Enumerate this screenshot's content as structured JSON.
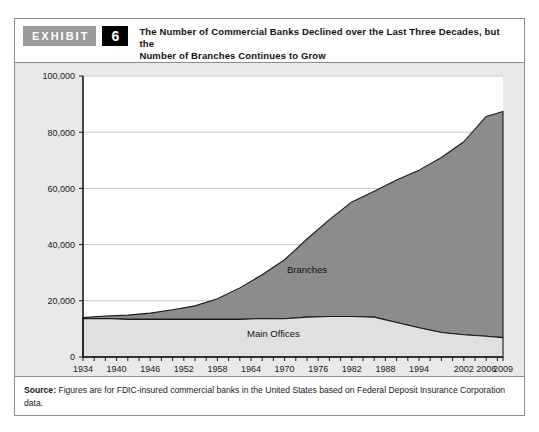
{
  "exhibit": {
    "badge_label": "EXHIBIT",
    "number": "6",
    "title_line1": "The Number of Commercial Banks Declined over the Last Three Decades, but the",
    "title_line2": "Number of Branches Continues to Grow"
  },
  "source": {
    "label": "Source:",
    "text": " Figures are for FDIC-insured commercial banks in the United States based on Federal Deposit Insurance Corporation data."
  },
  "colors": {
    "branches_fill": "#8c8c8c",
    "main_offices_fill": "#e0e0e0",
    "plot_background": "#ffffff",
    "chart_background": "#e9e9e9",
    "gridline": "#c9c9c9",
    "axis": "#1a1a1a",
    "badge_gray": "#9a9a9a",
    "badge_black": "#000000"
  },
  "chart_data": {
    "type": "area",
    "stacked": true,
    "title": "The Number of Commercial Banks Declined over the Last Three Decades, but the Number of Branches Continues to Grow",
    "xlabel": "",
    "ylabel": "",
    "xlim": [
      1934,
      2009
    ],
    "ylim": [
      0,
      100000
    ],
    "grid": true,
    "legend_position": "inline-labels",
    "ytick_labels": [
      "0",
      "20,000",
      "40,000",
      "60,000",
      "80,000",
      "100,000"
    ],
    "ytick_values": [
      0,
      20000,
      40000,
      60000,
      80000,
      100000
    ],
    "xtick_labels": [
      "1934",
      "1940",
      "1946",
      "1952",
      "1958",
      "1964",
      "1970",
      "1976",
      "1982",
      "1988",
      "1994",
      "2002",
      "2006",
      "2009"
    ],
    "xtick_values": [
      1934,
      1940,
      1946,
      1952,
      1958,
      1964,
      1970,
      1976,
      1982,
      1988,
      1994,
      2002,
      2006,
      2009
    ],
    "x": [
      1934,
      1938,
      1942,
      1946,
      1950,
      1954,
      1958,
      1962,
      1966,
      1970,
      1974,
      1978,
      1982,
      1986,
      1990,
      1994,
      1998,
      2002,
      2006,
      2009
    ],
    "series": [
      {
        "name": "Main Offices",
        "label": "Main Offices",
        "values": [
          13600,
          13700,
          13400,
          13400,
          13400,
          13400,
          13400,
          13400,
          13700,
          13600,
          14200,
          14400,
          14400,
          14200,
          12300,
          10400,
          8700,
          7900,
          7400,
          6900
        ]
      },
      {
        "name": "Branches",
        "label": "Branches",
        "values": [
          400,
          900,
          1500,
          2200,
          3400,
          4800,
          7300,
          11200,
          15600,
          21000,
          27800,
          34500,
          40800,
          44800,
          50700,
          56100,
          62300,
          68700,
          78200,
          80500
        ]
      }
    ],
    "totals": [
      14000,
      14600,
      14900,
      15600,
      16800,
      18200,
      20700,
      24600,
      29300,
      34600,
      42000,
      48900,
      55200,
      59000,
      63000,
      66500,
      71000,
      76600,
      85600,
      87400
    ],
    "annotations": [
      {
        "text": "Branches",
        "x": 1974,
        "y": 30000
      },
      {
        "text": "Main Offices",
        "x": 1968,
        "y": 7000
      }
    ]
  }
}
